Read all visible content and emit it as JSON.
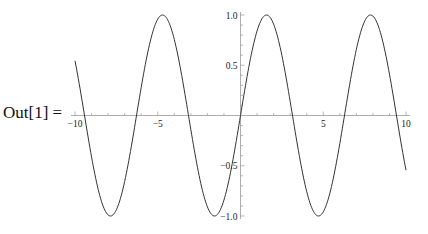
{
  "cell": {
    "output_label": "Out[1] ="
  },
  "chart_data": {
    "type": "line",
    "title": "",
    "function": "sin(x)",
    "xlabel": "",
    "ylabel": "",
    "xlim": [
      -10,
      10
    ],
    "ylim": [
      -1.0,
      1.0
    ],
    "grid": false,
    "legend": null,
    "x_ticks": [
      -10,
      -5,
      5,
      10
    ],
    "x_tick_labels": [
      "−10",
      "−5",
      "5",
      "10"
    ],
    "y_ticks": [
      1.0,
      0.5,
      -0.5,
      -1.0
    ],
    "y_tick_labels": [
      "1.0",
      "0.5",
      "−0.5",
      "−1.0"
    ],
    "series": [
      {
        "name": "sin(x)",
        "color": "#333333",
        "x": [
          -10,
          -9,
          -8,
          -7,
          -6,
          -5,
          -4,
          -3,
          -2,
          -1,
          0,
          1,
          2,
          3,
          4,
          5,
          6,
          7,
          8,
          9,
          10
        ],
        "values": [
          0.544,
          -0.412,
          -0.989,
          -0.657,
          0.279,
          0.959,
          0.757,
          -0.141,
          -0.909,
          -0.841,
          0.0,
          0.841,
          0.909,
          0.141,
          -0.757,
          -0.959,
          -0.279,
          0.657,
          0.989,
          0.412,
          -0.544
        ]
      }
    ]
  },
  "style": {
    "line_color": "#333333",
    "axis_color": "#999999"
  }
}
